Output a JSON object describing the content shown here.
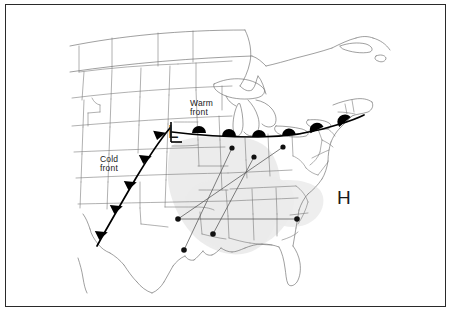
{
  "figure": {
    "type": "weather-map",
    "title": "",
    "region": "Contiguous United States (central and eastern)",
    "background_color": "#ffffff",
    "frame_color": "#2a2a2a",
    "shading_color": "#ebebeb"
  },
  "labels": {
    "warm_front": "Warm\nfront",
    "warm_front_line1": "Warm",
    "warm_front_line2": "front",
    "cold_front": "Cold\nfront",
    "cold_front_line1": "Cold",
    "cold_front_line2": "front",
    "low_pressure": "L",
    "high_pressure": "H"
  },
  "fronts": [
    {
      "name": "cold-front",
      "label": "Cold front",
      "symbol": "triangle",
      "symbol_count": 5,
      "color": "#000000",
      "orientation": "NE-SW",
      "path": [
        [
          99,
          243
        ],
        [
          112,
          218
        ],
        [
          126,
          194
        ],
        [
          140,
          170
        ],
        [
          154,
          146
        ],
        [
          166,
          127
        ]
      ],
      "symbol_positions": [
        [
          104,
          234
        ],
        [
          118,
          209
        ],
        [
          131,
          184
        ],
        [
          145,
          160
        ],
        [
          158,
          138
        ]
      ]
    },
    {
      "name": "warm-front",
      "label": "Warm front",
      "symbol": "semicircle",
      "symbol_count": 6,
      "color": "#000000",
      "orientation": "W-E",
      "path": [
        [
          174,
          131
        ],
        [
          205,
          133
        ],
        [
          240,
          135
        ],
        [
          275,
          135
        ],
        [
          305,
          132
        ],
        [
          335,
          126
        ],
        [
          360,
          118
        ]
      ],
      "symbol_positions": [
        [
          200,
          131
        ],
        [
          229,
          133
        ],
        [
          259,
          134
        ],
        [
          289,
          133
        ],
        [
          317,
          129
        ],
        [
          345,
          122
        ]
      ]
    }
  ],
  "pressure_centers": [
    {
      "type": "low",
      "label": "L",
      "x": 174,
      "y": 132
    },
    {
      "type": "high",
      "label": "H",
      "x": 344,
      "y": 198
    }
  ],
  "stations": [
    {
      "id": "s1",
      "x": 232,
      "y": 148
    },
    {
      "id": "s2",
      "x": 254,
      "y": 157
    },
    {
      "id": "s3",
      "x": 283,
      "y": 147
    },
    {
      "id": "s4",
      "x": 178,
      "y": 219
    },
    {
      "id": "s5",
      "x": 213,
      "y": 234
    },
    {
      "id": "s6",
      "x": 184,
      "y": 250
    },
    {
      "id": "s7",
      "x": 297,
      "y": 219
    }
  ],
  "trajectories": [
    {
      "id": "t1",
      "from": "s6",
      "to": "s1",
      "points": [
        [
          184,
          250
        ],
        [
          232,
          148
        ]
      ]
    },
    {
      "id": "t2",
      "from": "s5",
      "to": "s2",
      "points": [
        [
          213,
          234
        ],
        [
          254,
          157
        ]
      ]
    },
    {
      "id": "t3",
      "from": "s4",
      "to": "s3",
      "points": [
        [
          178,
          219
        ],
        [
          283,
          147
        ]
      ]
    },
    {
      "id": "t4",
      "from": "s4",
      "to": "s7",
      "points": [
        [
          178,
          219
        ],
        [
          297,
          219
        ]
      ]
    }
  ],
  "shaded_region": {
    "name": "precipitation-shading",
    "color": "#ebebeb",
    "description": "Light gray shaded area over the lower Mississippi Valley"
  }
}
